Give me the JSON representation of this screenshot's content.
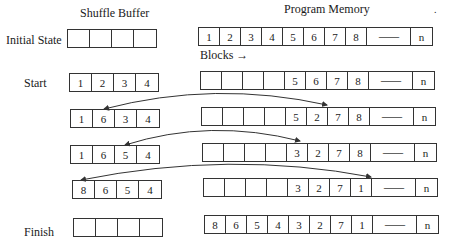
{
  "headings": {
    "shuffle_buffer": "Shuffle Buffer",
    "program_memory": "Program Memory",
    "blocks": "Blocks →",
    "corner_mark": "."
  },
  "rows": [
    {
      "label": "Initial State",
      "buffer": [
        "",
        "",
        "",
        ""
      ],
      "memory": [
        "1",
        "2",
        "3",
        "4",
        "5",
        "6",
        "7",
        "8",
        "----------",
        "n"
      ]
    },
    {
      "label": "Start",
      "buffer": [
        "1",
        "2",
        "3",
        "4"
      ],
      "memory": [
        "",
        "",
        "",
        "",
        "5",
        "6",
        "7",
        "8",
        "----------",
        "n"
      ]
    },
    {
      "label": "",
      "buffer": [
        "1",
        "6",
        "3",
        "4"
      ],
      "memory": [
        "",
        "",
        "",
        "",
        "5",
        "2",
        "7",
        "8",
        "----------",
        "n"
      ]
    },
    {
      "label": "",
      "buffer": [
        "1",
        "6",
        "5",
        "4"
      ],
      "memory": [
        "",
        "",
        "",
        "",
        "3",
        "2",
        "7",
        "8",
        "----------",
        "n"
      ]
    },
    {
      "label": "",
      "buffer": [
        "8",
        "6",
        "5",
        "4"
      ],
      "memory": [
        "",
        "",
        "",
        "",
        "3",
        "2",
        "7",
        "1",
        "----------",
        "n"
      ]
    },
    {
      "label": "Finish",
      "buffer": [
        "",
        "",
        "",
        ""
      ],
      "memory": [
        "8",
        "6",
        "5",
        "4",
        "3",
        "2",
        "7",
        "1",
        "----------",
        "n"
      ]
    }
  ],
  "swaps": [
    {
      "from": "buffer slot 2",
      "to": "memory block 6",
      "row": 2
    },
    {
      "from": "buffer slot 3",
      "to": "memory block 5",
      "row": 3
    },
    {
      "from": "buffer slot 1",
      "to": "memory block 8",
      "row": 4
    }
  ],
  "colors": {
    "line": "#333333",
    "text": "#1a1a1a",
    "background": "#ffffff"
  }
}
